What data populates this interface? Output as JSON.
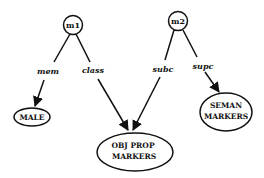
{
  "diagram": {
    "nodes": [
      {
        "id": "m1",
        "label": "m1",
        "shape": "circle"
      },
      {
        "id": "m2",
        "label": "m2",
        "shape": "circle"
      },
      {
        "id": "male",
        "label": "MALE",
        "shape": "ellipse"
      },
      {
        "id": "objprop",
        "label_line1": "OBJ PROP",
        "label_line2": "MARKERS",
        "shape": "ellipse"
      },
      {
        "id": "seman",
        "label_line1": "SEMAN",
        "label_line2": "MARKERS",
        "shape": "ellipse"
      }
    ],
    "edges": [
      {
        "from": "m1",
        "to": "male",
        "label": "mem"
      },
      {
        "from": "m1",
        "to": "objprop",
        "label": "class"
      },
      {
        "from": "m2",
        "to": "objprop",
        "label": "subc"
      },
      {
        "from": "m2",
        "to": "seman",
        "label": "supc"
      }
    ],
    "colors": {
      "stroke": "#111111",
      "background": "#ffffff"
    }
  }
}
